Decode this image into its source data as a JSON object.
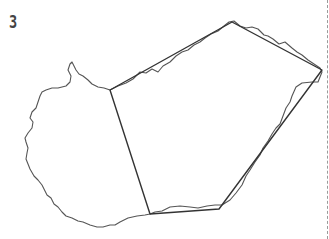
{
  "panel": {
    "label": "3"
  },
  "colors": {
    "outline": "#555555",
    "hull": "#333333",
    "divider": "#9a9a9a"
  },
  "drawing": {
    "hull_points": "110,90 232,22 322,70 219,209 150,214",
    "outline_points": "110,90 118,86 126,83 133,79 140,72 146,73 152,69 158,72 163,66 170,62 176,56 182,52 188,50 194,45 200,42 205,38 211,34 218,31 224,26 229,22 234,21 240,26 246,28 252,27 258,29 264,35 268,36 273,39 279,44 285,42 292,48 297,52 302,55 308,60 314,64 320,68 322,72 318,82 312,82 302,83 296,87 292,96 290,102 286,108 283,116 280,124 276,128 272,134 268,141 263,148 260,155 255,162 250,170 246,176 242,185 236,193 230,200 222,205 215,205 207,206 198,208 190,207 180,206 170,207 162,211 155,212 150,214 145,215 137,216 128,218 120,222 115,225 110,225 103,227 97,227 90,225 83,222 78,221 72,218 66,216 62,212 58,207 54,204 51,198 47,195 44,189 42,185 38,180 34,176 30,169 28,164 26,159 27,153 28,148 26,142 25,138 28,133 32,128 33,122 30,118 32,112 36,108 38,102 40,96 42,92 46,90 52,88 58,88 66,86 70,82 71,76 68,70 70,64 72,62 74,66 76,70 79,74 83,76 88,80 92,84 98,87 104,88 110,90"
  }
}
